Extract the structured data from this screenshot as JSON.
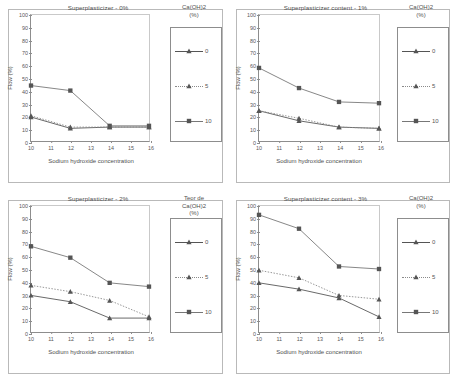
{
  "figure": {
    "axis": {
      "xlabel": "Sodium hydroxide concentration",
      "ylabel": "Flow (%)",
      "xticks": [
        "10",
        "11",
        "12",
        "13",
        "14",
        "15",
        "16"
      ],
      "yticks": [
        "0",
        "10",
        "20",
        "30",
        "40",
        "50",
        "60",
        "70",
        "80",
        "90",
        "100"
      ],
      "xlim": [
        10,
        16
      ],
      "ylim": [
        0,
        100
      ]
    },
    "series_style": {
      "s0": {
        "marker": "triangle",
        "line": "solid",
        "color": "#555555"
      },
      "s5": {
        "marker": "triangle",
        "line": "dotted",
        "color": "#8a8a8a"
      },
      "s10": {
        "marker": "square",
        "line": "solid",
        "color": "#777777"
      }
    },
    "panels": [
      {
        "id": "panel-0",
        "title": "Superplasticizer - 0%",
        "legend_title": "Ca(OH)2\n(%)",
        "legend_title_lines": [
          "Ca(OH)2",
          "(%)"
        ],
        "legend_labels": [
          "0",
          "5",
          "10"
        ]
      },
      {
        "id": "panel-1",
        "title": "Superplasticizer content - 1%",
        "legend_title_lines": [
          "Ca(OH)2",
          "(%)"
        ],
        "legend_labels": [
          "0",
          "5",
          "10"
        ]
      },
      {
        "id": "panel-2",
        "title": "Superplasticizer - 2%",
        "legend_title_lines": [
          "Teor de",
          "Ca(OH)2",
          "(%)"
        ],
        "legend_labels": [
          "0",
          "5",
          "10"
        ]
      },
      {
        "id": "panel-3",
        "title": "Superplasticizer content - 3%",
        "legend_title_lines": [
          "Ca(OH)2",
          "(%)"
        ],
        "legend_labels": [
          "0",
          "5",
          "10"
        ]
      }
    ]
  },
  "chart_data": [
    {
      "type": "line",
      "title": "Superplasticizer - 0%",
      "xlabel": "Sodium hydroxide concentration",
      "ylabel": "Flow (%)",
      "xlim": [
        10,
        16
      ],
      "ylim": [
        0,
        100
      ],
      "grid": false,
      "legend_position": "right",
      "legend_title": "Ca(OH)2 (%)",
      "x": [
        10,
        12,
        14,
        16
      ],
      "series": [
        {
          "name": "0",
          "values": [
            19,
            10,
            11,
            11
          ]
        },
        {
          "name": "5",
          "values": [
            20,
            11,
            11,
            11
          ]
        },
        {
          "name": "10",
          "values": [
            44,
            40,
            12,
            12
          ]
        }
      ]
    },
    {
      "type": "line",
      "title": "Superplasticizer content - 1%",
      "xlabel": "Sodium hydroxide concentration",
      "ylabel": "Flow (%)",
      "xlim": [
        10,
        16
      ],
      "ylim": [
        0,
        100
      ],
      "grid": false,
      "legend_position": "right",
      "legend_title": "Ca(OH)2 (%)",
      "x": [
        10,
        12,
        14,
        16
      ],
      "series": [
        {
          "name": "0",
          "values": [
            24,
            16,
            11,
            10
          ]
        },
        {
          "name": "5",
          "values": [
            24,
            18,
            11,
            10
          ]
        },
        {
          "name": "10",
          "values": [
            58,
            42,
            31,
            30
          ]
        }
      ]
    },
    {
      "type": "line",
      "title": "Superplasticizer - 2%",
      "xlabel": "Sodium hydroxide concentration",
      "ylabel": "Flow (%)",
      "xlim": [
        10,
        16
      ],
      "ylim": [
        0,
        100
      ],
      "grid": false,
      "legend_position": "right",
      "legend_title": "Teor de Ca(OH)2 (%)",
      "x": [
        10,
        12,
        14,
        16
      ],
      "series": [
        {
          "name": "0",
          "values": [
            29,
            24,
            11,
            11
          ]
        },
        {
          "name": "5",
          "values": [
            37,
            32,
            25,
            12
          ]
        },
        {
          "name": "10",
          "values": [
            68,
            59,
            39,
            36
          ]
        }
      ]
    },
    {
      "type": "line",
      "title": "Superplasticizer content - 3%",
      "xlabel": "Sodium hydroxide concentration",
      "ylabel": "Flow (%)",
      "xlim": [
        10,
        16
      ],
      "ylim": [
        0,
        100
      ],
      "grid": false,
      "legend_position": "right",
      "legend_title": "Ca(OH)2 (%)",
      "x": [
        10,
        12,
        14,
        16
      ],
      "series": [
        {
          "name": "0",
          "values": [
            39,
            34,
            27,
            12
          ]
        },
        {
          "name": "5",
          "values": [
            49,
            43,
            29,
            26
          ]
        },
        {
          "name": "10",
          "values": [
            93,
            82,
            52,
            50
          ]
        }
      ]
    }
  ]
}
